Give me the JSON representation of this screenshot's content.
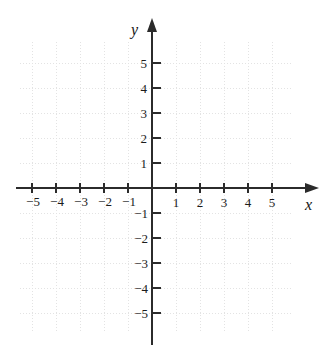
{
  "figure": {
    "kind": "cartesian-coordinate-plane",
    "width": 325,
    "height": 362,
    "background_color": "#ffffff"
  },
  "axes": {
    "x_label": "x",
    "y_label": "y",
    "axis_color": "#2b2b2b",
    "origin": {
      "x": 152,
      "y": 188
    },
    "unit_px_x": 24,
    "unit_px_y": 25,
    "x_arrow": "arrow-right",
    "y_arrow": "arrow-up"
  },
  "grid": {
    "visible": true,
    "style": "dotted",
    "color": "#e3e3e3",
    "left": 20,
    "top": 42,
    "right": 292,
    "bottom": 332
  },
  "ticks": {
    "x_negative": [
      "−5",
      "−4",
      "−3",
      "−2",
      "−1"
    ],
    "x_positive": [
      "1",
      "2",
      "3",
      "4",
      "5"
    ],
    "y_positive": [
      "5",
      "4",
      "3",
      "2",
      "1"
    ],
    "y_negative": [
      "−1",
      "−2",
      "−3",
      "−4",
      "−5"
    ]
  },
  "chart_data": {
    "type": "scatter",
    "title": "",
    "xlabel": "x",
    "ylabel": "y",
    "xlim": [
      -5,
      5
    ],
    "ylim": [
      -5,
      5
    ],
    "xticks": [
      -5,
      -4,
      -3,
      -2,
      -1,
      1,
      2,
      3,
      4,
      5
    ],
    "yticks": [
      -5,
      -4,
      -3,
      -2,
      -1,
      1,
      2,
      3,
      4,
      5
    ],
    "grid": true,
    "legend": "none",
    "series": [],
    "x": [],
    "values": [],
    "annotations": []
  }
}
